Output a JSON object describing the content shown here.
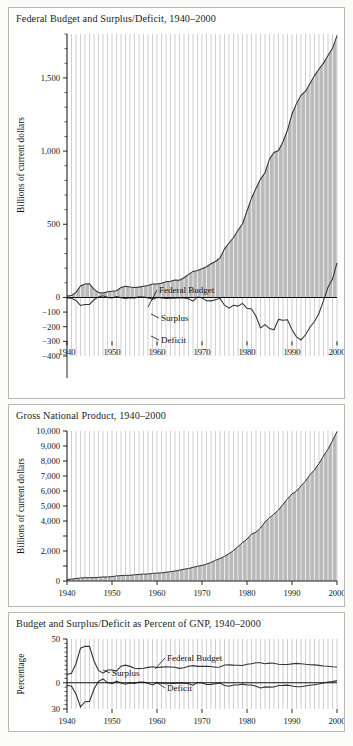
{
  "figure": {
    "background": "#fbfbf9",
    "panel_border": "#b9b9b4",
    "fill_color": "#a0a0a0",
    "grid_color": "#ffffff",
    "line_color": "#333333"
  },
  "panels": [
    {
      "id": "federal-budget",
      "title": "Federal Budget and Surplus/Deficit, 1940–2000",
      "ylabel": "Billions of current dollars",
      "yticks": [
        "1,500",
        "1,000",
        "500",
        "0",
        "−100",
        "−200",
        "−300",
        "−400"
      ],
      "xticks": [
        "1940",
        "1950",
        "1960",
        "1970",
        "1980",
        "1990",
        "2000"
      ],
      "annotations": [
        "Federal Budget",
        "Surplus",
        "Deficit"
      ]
    },
    {
      "id": "gross-national-product",
      "title": "Gross National Product, 1940–2000",
      "ylabel": "Billions of current dollars",
      "yticks": [
        "10,000",
        "9,000",
        "8,000",
        "7,000",
        "6,000",
        "5,000",
        "4,000",
        "3,000",
        "2,000",
        "1,000",
        "0"
      ],
      "xticks": [
        "1940",
        "1950",
        "1960",
        "1970",
        "1980",
        "1990",
        "2000"
      ],
      "annotations": []
    },
    {
      "id": "percent-of-gnp",
      "title": "Budget and Surplus/Deficit as Percent of GNP, 1940–2000",
      "ylabel": "Percentage",
      "yticks": [
        "50",
        "0",
        "30"
      ],
      "xticks": [
        "1940",
        "1950",
        "1960",
        "1970",
        "1980",
        "1990",
        "2000"
      ],
      "annotations": [
        "Federal Budget",
        "Surplus",
        "Deficit"
      ]
    }
  ],
  "chart_data": [
    {
      "type": "area",
      "id": "federal-budget",
      "title": "Federal Budget and Surplus/Deficit, 1940–2000",
      "xlabel": "",
      "ylabel": "Billions of current dollars",
      "xlim": [
        1940,
        2000
      ],
      "ylim": [
        -400,
        1800
      ],
      "grid": "vertical-annual",
      "legend": "inline-annotations",
      "x": [
        1940,
        1941,
        1942,
        1943,
        1944,
        1945,
        1946,
        1947,
        1948,
        1949,
        1950,
        1951,
        1952,
        1953,
        1954,
        1955,
        1956,
        1957,
        1958,
        1959,
        1960,
        1961,
        1962,
        1963,
        1964,
        1965,
        1966,
        1967,
        1968,
        1969,
        1970,
        1971,
        1972,
        1973,
        1974,
        1975,
        1976,
        1977,
        1978,
        1979,
        1980,
        1981,
        1982,
        1983,
        1984,
        1985,
        1986,
        1987,
        1988,
        1989,
        1990,
        1991,
        1992,
        1993,
        1994,
        1995,
        1996,
        1997,
        1998,
        1999,
        2000
      ],
      "series": [
        {
          "name": "Federal Budget",
          "units": "billions of current dollars",
          "values": [
            9.5,
            13.7,
            35.1,
            78.6,
            91.3,
            92.7,
            55.2,
            34.5,
            29.8,
            38.8,
            42.6,
            45.5,
            67.7,
            76.1,
            70.9,
            68.4,
            70.6,
            76.6,
            82.4,
            92.1,
            92.2,
            97.7,
            106.8,
            111.3,
            118.5,
            118.2,
            134.5,
            157.5,
            178.1,
            183.6,
            195.6,
            210.2,
            230.7,
            245.7,
            269.4,
            332.3,
            371.8,
            409.2,
            458.7,
            504.0,
            590.9,
            678.2,
            745.8,
            808.4,
            851.8,
            946.4,
            990.3,
            1004.0,
            1064.4,
            1143.7,
            1253.2,
            1324.4,
            1381.5,
            1409.4,
            1461.8,
            1515.8,
            1560.5,
            1601.2,
            1652.6,
            1701.9,
            1789.1
          ]
        },
        {
          "name": "Surplus/Deficit",
          "units": "billions of current dollars",
          "values": [
            -2.9,
            -4.9,
            -20.5,
            -54.6,
            -47.6,
            -47.6,
            -15.9,
            4.0,
            11.8,
            0.6,
            -3.1,
            6.1,
            -1.5,
            -6.5,
            -1.2,
            -3.0,
            3.9,
            3.4,
            -2.8,
            -12.8,
            0.3,
            -3.3,
            -7.1,
            -4.8,
            -5.9,
            -1.4,
            -3.7,
            -8.6,
            -25.2,
            3.2,
            -2.8,
            -23.0,
            -23.4,
            -14.9,
            -6.1,
            -53.2,
            -73.7,
            -53.7,
            -59.2,
            -40.7,
            -73.8,
            -79.0,
            -128.0,
            -207.8,
            -185.4,
            -212.3,
            -221.2,
            -149.7,
            -155.2,
            -152.6,
            -221.2,
            -269.3,
            -290.3,
            -255.1,
            -203.2,
            -164.0,
            -107.4,
            -21.9,
            69.3,
            125.6,
            236.4
          ]
        }
      ]
    },
    {
      "type": "area",
      "id": "gross-national-product",
      "title": "Gross National Product, 1940–2000",
      "xlabel": "",
      "ylabel": "Billions of current dollars",
      "xlim": [
        1940,
        2000
      ],
      "ylim": [
        0,
        10000
      ],
      "grid": "vertical-annual",
      "legend": "none",
      "x": [
        1940,
        1941,
        1942,
        1943,
        1944,
        1945,
        1946,
        1947,
        1948,
        1949,
        1950,
        1951,
        1952,
        1953,
        1954,
        1955,
        1956,
        1957,
        1958,
        1959,
        1960,
        1961,
        1962,
        1963,
        1964,
        1965,
        1966,
        1967,
        1968,
        1969,
        1970,
        1971,
        1972,
        1973,
        1974,
        1975,
        1976,
        1977,
        1978,
        1979,
        1980,
        1981,
        1982,
        1983,
        1984,
        1985,
        1986,
        1987,
        1988,
        1989,
        1990,
        1991,
        1992,
        1993,
        1994,
        1995,
        1996,
        1997,
        1998,
        1999,
        2000
      ],
      "series": [
        {
          "name": "Gross National Product",
          "units": "billions of current dollars",
          "values": [
            101,
            127,
            162,
            199,
            219,
            223,
            222,
            244,
            270,
            267,
            294,
            339,
            358,
            379,
            380,
            415,
            438,
            461,
            467,
            507,
            527,
            545,
            586,
            618,
            664,
            720,
            788,
            833,
            910,
            984,
            1038,
            1127,
            1238,
            1383,
            1500,
            1638,
            1825,
            2031,
            2295,
            2563,
            2790,
            3128,
            3255,
            3536,
            3933,
            4220,
            4463,
            4740,
            5103,
            5484,
            5803,
            5996,
            6338,
            6667,
            7085,
            7415,
            7839,
            8332,
            8794,
            9354,
            9963
          ]
        }
      ]
    },
    {
      "type": "line",
      "id": "percent-of-gnp",
      "title": "Budget and Surplus/Deficit as Percent of GNP, 1940–2000",
      "xlabel": "",
      "ylabel": "Percentage",
      "xlim": [
        1940,
        2000
      ],
      "ylim": [
        -30,
        50
      ],
      "grid": "vertical-annual",
      "legend": "inline-annotations",
      "x": [
        1940,
        1941,
        1942,
        1943,
        1944,
        1945,
        1946,
        1947,
        1948,
        1949,
        1950,
        1951,
        1952,
        1953,
        1954,
        1955,
        1956,
        1957,
        1958,
        1959,
        1960,
        1961,
        1962,
        1963,
        1964,
        1965,
        1966,
        1967,
        1968,
        1969,
        1970,
        1971,
        1972,
        1973,
        1974,
        1975,
        1976,
        1977,
        1978,
        1979,
        1980,
        1981,
        1982,
        1983,
        1984,
        1985,
        1986,
        1987,
        1988,
        1989,
        1990,
        1991,
        1992,
        1993,
        1994,
        1995,
        1996,
        1997,
        1998,
        1999,
        2000
      ],
      "series": [
        {
          "name": "Federal Budget",
          "units": "percent of GNP",
          "values": [
            9.4,
            10.8,
            21.7,
            39.5,
            41.7,
            41.6,
            24.9,
            14.1,
            11.0,
            14.5,
            14.5,
            13.4,
            18.9,
            20.1,
            18.7,
            16.5,
            16.1,
            16.6,
            17.6,
            18.2,
            17.5,
            17.9,
            18.2,
            18.0,
            17.8,
            16.4,
            17.1,
            18.9,
            19.6,
            18.7,
            18.8,
            18.7,
            18.6,
            17.8,
            18.0,
            20.3,
            20.4,
            20.1,
            20.0,
            19.7,
            21.2,
            21.7,
            22.9,
            22.9,
            21.7,
            22.4,
            22.2,
            21.2,
            20.9,
            20.9,
            21.6,
            22.1,
            21.8,
            21.1,
            20.6,
            20.4,
            19.9,
            19.2,
            18.8,
            18.2,
            18.0
          ],
          "label_x": 1976
        },
        {
          "name": "Surplus/Deficit",
          "units": "percent of GNP",
          "values": [
            -2.9,
            -3.9,
            -12.7,
            -27.5,
            -21.7,
            -21.3,
            -7.2,
            1.6,
            4.4,
            0.2,
            -1.1,
            1.8,
            -0.4,
            -1.7,
            -0.3,
            -0.7,
            0.9,
            0.7,
            -0.6,
            -2.5,
            0.1,
            -0.6,
            -1.2,
            -0.8,
            -0.9,
            -0.2,
            -0.5,
            -1.0,
            -2.8,
            0.3,
            -0.3,
            -2.0,
            -1.9,
            -1.1,
            -0.4,
            -3.2,
            -4.0,
            -2.6,
            -2.6,
            -1.6,
            -2.6,
            -2.5,
            -3.9,
            -5.9,
            -4.7,
            -5.0,
            -4.9,
            -3.1,
            -3.0,
            -2.7,
            -3.8,
            -4.5,
            -4.6,
            -3.8,
            -2.9,
            -2.2,
            -1.4,
            -0.3,
            0.8,
            1.3,
            2.4
          ],
          "labels": [
            "Surplus",
            "Deficit"
          ]
        }
      ]
    }
  ]
}
